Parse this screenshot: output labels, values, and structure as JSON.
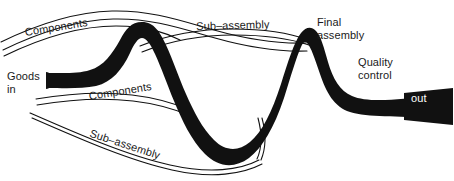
{
  "diagram": {
    "colors": {
      "ink": "#111111",
      "background": "#ffffff",
      "label_on_dark": "#ffffff"
    },
    "labels": {
      "goods_in": "Goods\nin",
      "components_top": "Components",
      "components_bottom": "Components",
      "subassembly_top": "Sub–assembly",
      "subassembly_bottom": "Sub–assembly",
      "final_assembly": "Final\nassembly",
      "quality_control": "Quality\ncontrol",
      "goods_out": "Goods\nout"
    },
    "stages": [
      {
        "id": "goods-in",
        "label": "Goods in",
        "kind": "input-terminal"
      },
      {
        "id": "components",
        "label": "Components",
        "kind": "feeder-stream"
      },
      {
        "id": "sub-assembly",
        "label": "Sub–assembly",
        "kind": "feeder-stream"
      },
      {
        "id": "final-assembly",
        "label": "Final assembly",
        "kind": "main-flow-peak"
      },
      {
        "id": "quality-control",
        "label": "Quality control",
        "kind": "main-flow-stage"
      },
      {
        "id": "goods-out",
        "label": "Goods out",
        "kind": "output-terminal"
      }
    ],
    "feeder_streams": [
      {
        "label": "Components",
        "position": "upper-left",
        "merges_into": "main-flow"
      },
      {
        "label": "Sub–assembly",
        "position": "upper-right",
        "merges_into": "main-flow"
      },
      {
        "label": "Components",
        "position": "lower-left",
        "merges_into": "main-flow"
      },
      {
        "label": "Sub–assembly",
        "position": "lower-bottom",
        "merges_into": "main-flow"
      }
    ]
  }
}
